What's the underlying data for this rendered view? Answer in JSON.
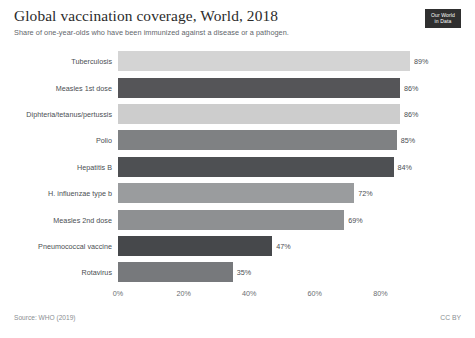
{
  "header": {
    "title": "Global vaccination coverage, World, 2018",
    "subtitle": "Share of one-year-olds who have been immunized against a disease or a pathogen.",
    "logo_line1": "Our World",
    "logo_line2": "in Data"
  },
  "footer": {
    "source": "Source: WHO (2019)",
    "license": "CC BY"
  },
  "chart_data": {
    "type": "bar",
    "orientation": "horizontal",
    "title": "Global vaccination coverage, World, 2018",
    "subtitle": "Share of one-year-olds who have been immunized against a disease or a pathogen.",
    "xlabel": "",
    "ylabel": "",
    "xlim": [
      0,
      100
    ],
    "grid": false,
    "legend": "none",
    "tick_labels": [
      "0%",
      "20%",
      "40%",
      "60%",
      "80%"
    ],
    "tick_values": [
      0,
      20,
      40,
      60,
      80
    ],
    "categories": [
      "Tuberculosis",
      "Measles 1st dose",
      "Diphteria/tetanus/pertussis",
      "Polio",
      "Hepatitis B",
      "H. influenzae type b",
      "Measles 2nd dose",
      "Pneumococcal vaccine",
      "Rotavirus"
    ],
    "values": [
      89,
      86,
      86,
      85,
      84,
      72,
      69,
      47,
      35
    ],
    "value_labels": [
      "89%",
      "86%",
      "86%",
      "85%",
      "84%",
      "72%",
      "69%",
      "47%",
      "35%"
    ],
    "colors": [
      "#d4d4d4",
      "#555558",
      "#cdcdcd",
      "#7f8183",
      "#4e5053",
      "#9a9c9e",
      "#8e9092",
      "#46484b",
      "#77797c"
    ]
  }
}
